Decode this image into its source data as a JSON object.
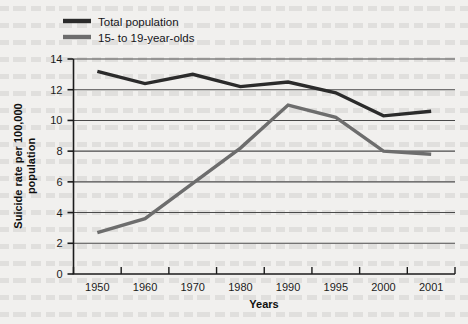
{
  "chart_data": {
    "type": "line",
    "title": "",
    "xlabel": "Years",
    "ylabel": "Suicide rate per 100,000 population",
    "categories": [
      "1950",
      "1960",
      "1970",
      "1980",
      "1990",
      "1995",
      "2000",
      "2001"
    ],
    "ylim": [
      0,
      14
    ],
    "ytick_values": [
      0,
      2,
      4,
      6,
      8,
      10,
      12,
      14
    ],
    "ytick_labels": [
      "0",
      "2",
      "4",
      "6",
      "8",
      "10",
      "12",
      "14"
    ],
    "grid": "horizontal",
    "legend_position": "top-left",
    "series": [
      {
        "name": "Total population",
        "color": "#2b2b2b",
        "values": [
          13.2,
          12.4,
          13.0,
          12.2,
          12.5,
          11.8,
          10.3,
          10.6
        ]
      },
      {
        "name": "15- to 19-year-olds",
        "color": "#6d6d6d",
        "values": [
          2.7,
          3.6,
          5.9,
          8.2,
          11.0,
          10.2,
          8.0,
          7.8
        ]
      }
    ]
  },
  "axis": {
    "y_label_line1": "Suicide rate per 100,000",
    "y_label_line2": "population",
    "x_label": "Years"
  },
  "legend": {
    "items": [
      {
        "label": "Total population",
        "color": "#2b2b2b"
      },
      {
        "label": "15- to 19-year-olds",
        "color": "#6d6d6d"
      }
    ]
  },
  "colors": {
    "background": "#f1f0ee",
    "axis": "#1b1b1b",
    "gridline": "#4a4a4a",
    "total_population": "#2b2b2b",
    "youth": "#6d6d6d"
  }
}
